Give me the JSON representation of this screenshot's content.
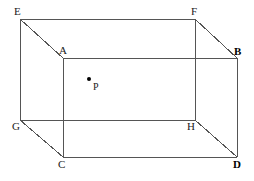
{
  "figure": {
    "type": "geometric-diagram",
    "canvas": {
      "width": 254,
      "height": 181
    },
    "colors": {
      "background": "#ffffff",
      "edge_stroke": "#555555",
      "label_text": "#1a1a1a",
      "point_fill": "#000000"
    },
    "vertices": [
      {
        "id": "E",
        "label": "E",
        "x": 20,
        "y": 19,
        "label_x": 14,
        "label_y": 6,
        "bold": false
      },
      {
        "id": "F",
        "label": "F",
        "x": 195,
        "y": 19,
        "label_x": 191,
        "label_y": 6,
        "bold": false
      },
      {
        "id": "A",
        "label": "A",
        "x": 63,
        "y": 58,
        "label_x": 59,
        "label_y": 45,
        "bold": false
      },
      {
        "id": "B",
        "label": "B",
        "x": 237,
        "y": 58,
        "label_x": 234,
        "label_y": 46,
        "bold": true
      },
      {
        "id": "G",
        "label": "G",
        "x": 20,
        "y": 120,
        "label_x": 12,
        "label_y": 121,
        "bold": false
      },
      {
        "id": "H",
        "label": "H",
        "x": 195,
        "y": 120,
        "label_x": 187,
        "label_y": 121,
        "bold": false
      },
      {
        "id": "C",
        "label": "C",
        "x": 63,
        "y": 157,
        "label_x": 58,
        "label_y": 159,
        "bold": false
      },
      {
        "id": "D",
        "label": "D",
        "x": 237,
        "y": 157,
        "label_x": 233,
        "label_y": 159,
        "bold": true
      }
    ],
    "edges": [
      {
        "from": "E",
        "to": "F",
        "name": "edge-EF"
      },
      {
        "from": "E",
        "to": "G",
        "name": "edge-EG"
      },
      {
        "from": "E",
        "to": "A",
        "name": "edge-EA"
      },
      {
        "from": "F",
        "to": "H",
        "name": "edge-FH"
      },
      {
        "from": "F",
        "to": "B",
        "name": "edge-FB"
      },
      {
        "from": "G",
        "to": "H",
        "name": "edge-GH"
      },
      {
        "from": "G",
        "to": "C",
        "name": "edge-GC"
      },
      {
        "from": "A",
        "to": "B",
        "name": "edge-AB"
      },
      {
        "from": "A",
        "to": "C",
        "name": "edge-AC"
      },
      {
        "from": "B",
        "to": "D",
        "name": "edge-BD"
      },
      {
        "from": "C",
        "to": "D",
        "name": "edge-CD"
      },
      {
        "from": "H",
        "to": "D",
        "name": "edge-HD"
      }
    ],
    "interior_point": {
      "id": "P",
      "label": "P",
      "x": 89,
      "y": 79,
      "radius": 2,
      "label_x": 93,
      "label_y": 82
    }
  }
}
